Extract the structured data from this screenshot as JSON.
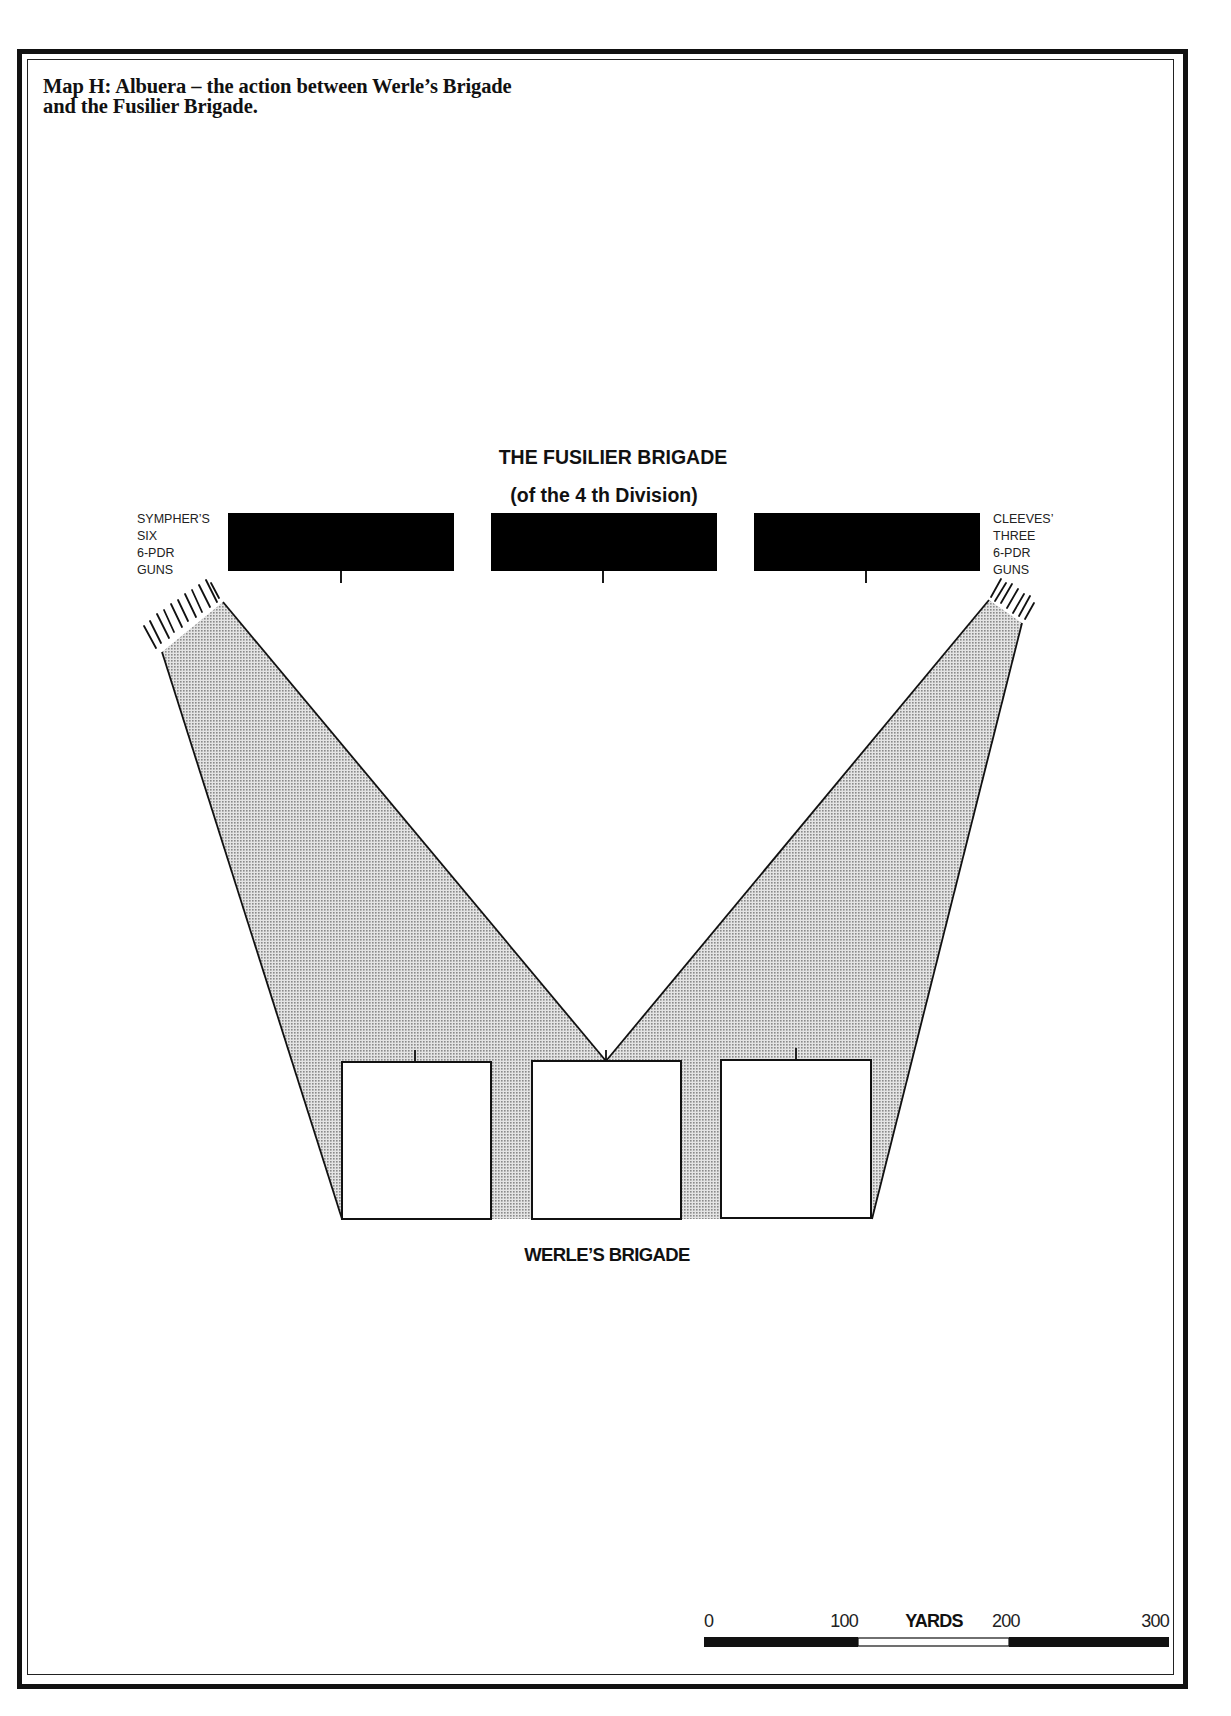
{
  "title": {
    "line1": "Map H: Albuera – the action between Werle’s Brigade",
    "line2": "and the Fusilier Brigade."
  },
  "fusilier_brigade": {
    "heading": "THE FUSILIER BRIGADE",
    "subheading": "(of the 4 th Division)",
    "battalion_count": 3,
    "color": "#000000"
  },
  "werle_brigade": {
    "label": "WERLE’S BRIGADE",
    "battalion_count": 3,
    "fill": "#ffffff"
  },
  "left_battery": {
    "lines": [
      "SYMPHER’S",
      "SIX",
      "6-PDR",
      "GUNS"
    ],
    "gun_count": 6
  },
  "right_battery": {
    "lines": [
      "CLEEVES’",
      "THREE",
      "6-PDR",
      "GUNS"
    ],
    "gun_count": 3
  },
  "fire_zone": {
    "fill": "#bdbdbd"
  },
  "scale_bar": {
    "unit": "YARDS",
    "ticks": [
      "0",
      "100",
      "200",
      "300"
    ]
  }
}
